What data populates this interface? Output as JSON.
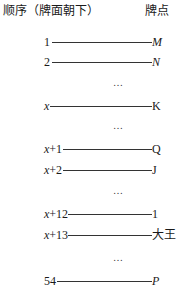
{
  "header": {
    "left": "顺序（牌面朝下）",
    "right": "牌点"
  },
  "rows": [
    {
      "order": "1",
      "card": "M",
      "card_italic": true,
      "order_italic_x": false
    },
    {
      "order": "2",
      "card": "N",
      "card_italic": true,
      "order_italic_x": false
    },
    {
      "order": "x",
      "card": "K",
      "card_italic": false,
      "order_italic_x": true
    },
    {
      "order": "x+1",
      "card": "Q",
      "card_italic": false,
      "order_italic_x": true
    },
    {
      "order": "x+2",
      "card": "J",
      "card_italic": false,
      "order_italic_x": true
    },
    {
      "order": "x+12",
      "card": "1",
      "card_italic": false,
      "order_italic_x": true
    },
    {
      "order": "x+13",
      "card": "大王",
      "card_italic": false,
      "order_italic_x": true
    },
    {
      "order": "54",
      "card": "P",
      "card_italic": true,
      "order_italic_x": false
    }
  ],
  "ellipsis": "…",
  "ellipses_count": 4
}
